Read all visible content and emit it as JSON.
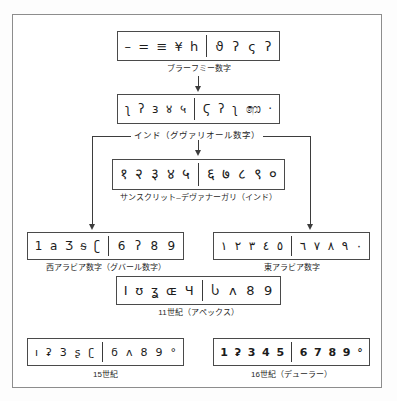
{
  "figure": {
    "frame_color": "#8d8d8d",
    "ink_color": "#1c1c1c"
  },
  "rows": [
    {
      "id": "brahmi",
      "caption": "ブラーフミー数字",
      "left_glyphs": [
        "–",
        "=",
        "≡",
        "¥",
        "h"
      ],
      "right_glyphs": [
        "ϑ",
        "ʔ",
        "ς",
        "ʔ"
      ]
    },
    {
      "id": "gwalior",
      "caption": "インド（グヴァリオール数字）",
      "left_glyphs": [
        "ʅ",
        "ʔ",
        "ɜ",
        "४",
        "५"
      ],
      "right_glyphs": [
        "Ϛ",
        "ʔ",
        "ʅ",
        "෩",
        "·"
      ]
    },
    {
      "id": "sanskrit-devanagari",
      "caption": "サンスクリット–デヴァナーガリ（インド）",
      "left_glyphs": [
        "१",
        "२",
        "३",
        "४",
        "५"
      ],
      "right_glyphs": [
        "६",
        "७",
        "८",
        "९",
        "०"
      ]
    },
    {
      "id": "west-arabic",
      "caption": "西アラビア数字（グバール数字）",
      "left_glyphs": [
        "1",
        "a",
        "Ʒ",
        "ᵴ",
        "ʗ"
      ],
      "right_glyphs": [
        "6",
        "ʔ",
        "8",
        "9"
      ]
    },
    {
      "id": "east-arabic",
      "caption": "東アラビア数字",
      "left_glyphs": [
        "١",
        "٢",
        "٣",
        "٤",
        "٥"
      ],
      "right_glyphs": [
        "٦",
        "٧",
        "٨",
        "٩",
        "٠"
      ]
    },
    {
      "id": "eleventh-century",
      "caption": "11世紀（アペックス）",
      "left_glyphs": [
        "I",
        "ʊ",
        "ʓ",
        "ɶ",
        "Ч"
      ],
      "right_glyphs": [
        "Ⴑ",
        "ʌ",
        "8",
        "9"
      ]
    },
    {
      "id": "fifteenth-century",
      "caption": "15世紀",
      "left_glyphs": [
        "ı",
        "ʡ",
        "3",
        "ʂ",
        "ʗ"
      ],
      "right_glyphs": [
        "ϭ",
        "ʌ",
        "8",
        "9",
        "°"
      ]
    },
    {
      "id": "sixteenth-century",
      "caption": "16世紀（デューラー）",
      "left_glyphs": [
        "1",
        "ʡ",
        "3",
        "4",
        "5"
      ],
      "right_glyphs": [
        "6",
        "7",
        "8",
        "9",
        "°"
      ]
    }
  ],
  "connectors": {
    "bracket_label": "インド（グヴァリオール数字）"
  }
}
